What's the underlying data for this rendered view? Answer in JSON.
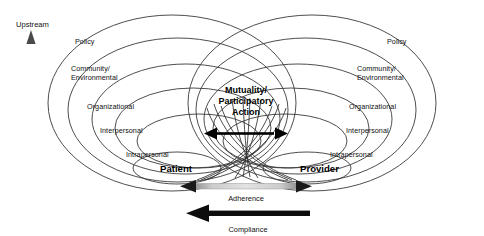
{
  "diagram": {
    "upstream_label": "Upstream",
    "center": {
      "line1": "Mutuality/",
      "line2": "Participatory",
      "line3": "Action"
    },
    "patient_side": {
      "actor": "Patient",
      "levels": [
        "Policy",
        "Community/",
        "Environmental",
        "Organizational",
        "Interpersonal",
        "Intrapersonal"
      ]
    },
    "provider_side": {
      "actor": "Provider",
      "levels": [
        "Policy",
        "Community/",
        "Environmental",
        "Organizational",
        "Interpersonal",
        "Intrapersonal"
      ]
    },
    "flows": {
      "adherence": "Adherence",
      "compliance": "Compliance"
    },
    "colors": {
      "line": "#3a3a3a",
      "text": "#111111",
      "arrow_black": "#000000",
      "arrow_gray": "#b7b7b7",
      "upstream_arrow": "#6e6e6e",
      "background": "#ffffff"
    }
  }
}
